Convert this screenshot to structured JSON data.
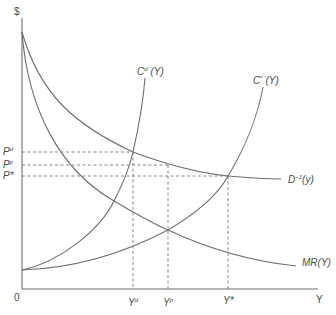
{
  "diagram": {
    "axes": {
      "y_label": "$",
      "x_label": "Y",
      "origin_label": "0"
    },
    "curves": [
      {
        "id": "demand-inverse",
        "label": "D",
        "superscript": "−1",
        "arg": "(y)"
      },
      {
        "id": "marginal-revenue",
        "label": "MR(Y)"
      },
      {
        "id": "marginal-cost-d",
        "label": "C",
        "superscript": "d ′",
        "arg": "(Y)"
      },
      {
        "id": "marginal-cost-star",
        "label": "C",
        "superscript": "* ′",
        "arg": "(Y)"
      }
    ],
    "price_levels": [
      {
        "id": "pd",
        "label": "P",
        "superscript": "d"
      },
      {
        "id": "pp",
        "label": "P",
        "superscript": "p"
      },
      {
        "id": "pstar",
        "label": "P*",
        "superscript": ""
      }
    ],
    "quantity_levels": [
      {
        "id": "yd",
        "label": "Y",
        "superscript": "d"
      },
      {
        "id": "yp",
        "label": "Y",
        "superscript": "p"
      },
      {
        "id": "ystar",
        "label": "Y*",
        "superscript": ""
      }
    ],
    "colors": {
      "line": "#6e6e6e",
      "text": "#4a4a4a",
      "background": "#ffffff"
    }
  }
}
